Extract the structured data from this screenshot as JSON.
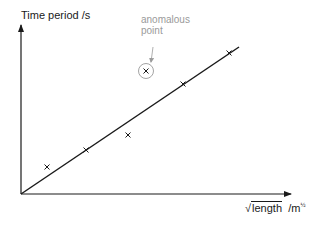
{
  "chart_data": {
    "type": "scatter",
    "title": "",
    "xlabel": "√length",
    "xlabel_unit": "/m½",
    "ylabel": "Time period",
    "ylabel_unit": "/s",
    "grid": false,
    "legend": null,
    "axis_ranges": {
      "x": [
        0,
        270
      ],
      "y": [
        0,
        170
      ]
    },
    "axis_ticks": "none (unlabeled axes, relative units)",
    "series": [
      {
        "name": "measurements",
        "marker": "x",
        "points": [
          {
            "x": 26,
            "y": 27
          },
          {
            "x": 65,
            "y": 44
          },
          {
            "x": 107,
            "y": 59
          },
          {
            "x": 125,
            "y": 123,
            "anomalous": true
          },
          {
            "x": 162,
            "y": 110
          },
          {
            "x": 208,
            "y": 141
          }
        ]
      }
    ],
    "best_fit_line": {
      "from": {
        "x": 0,
        "y": 0
      },
      "to": {
        "x": 218,
        "y": 147
      },
      "through_origin": true
    },
    "annotations": [
      {
        "text": "anomalous point",
        "target": {
          "x": 125,
          "y": 123
        },
        "style": "circled with arrow"
      }
    ]
  },
  "labels": {
    "y_axis": "Time period  /s",
    "x_axis_main": "length",
    "x_axis_unit": "/m",
    "x_axis_unit_exp": "½",
    "annotation_line1": "anomalous",
    "annotation_line2": "point"
  },
  "colors": {
    "axis": "#1a1a1a",
    "line": "#1a1a1a",
    "marker": "#1a1a1a",
    "annotation": "#9a9a9a"
  }
}
